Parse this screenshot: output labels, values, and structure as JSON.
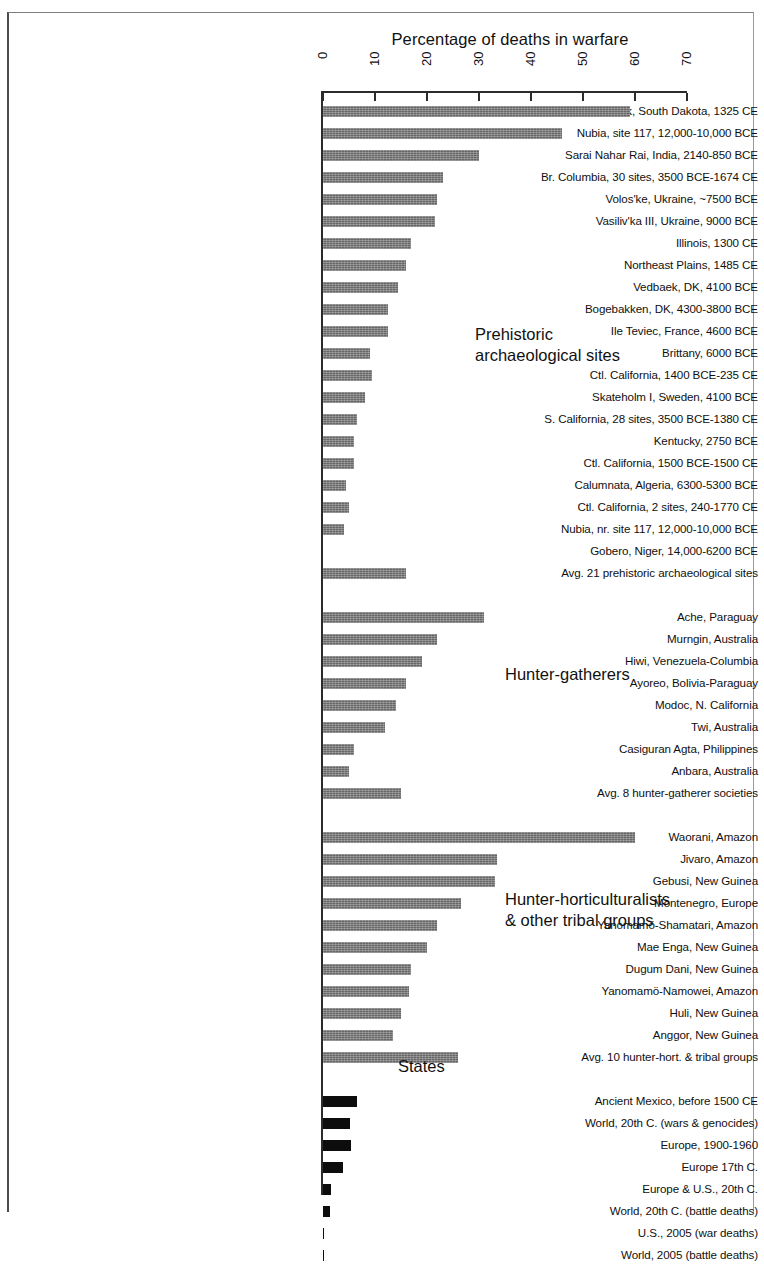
{
  "chart_data": {
    "type": "bar",
    "orientation": "horizontal",
    "title": "Percentage of deaths in warfare",
    "xlabel": "Percentage of deaths in warfare",
    "ylabel": "",
    "xlim": [
      0,
      70
    ],
    "xticks": [
      "0",
      "10",
      "20",
      "30",
      "40",
      "50",
      "60",
      "70"
    ],
    "grid": false,
    "legend": "none",
    "groups": [
      {
        "name": "Prehistoric archaeological sites",
        "annotation_lines": [
          "Prehistoric",
          "archaeological sites"
        ],
        "bar_style": "gray",
        "categories": [
          "Crow Creek, South Dakota, 1325 CE",
          "Nubia, site 117, 12,000-10,000 BCE",
          "Sarai Nahar Rai, India, 2140-850 BCE",
          "Br. Columbia, 30 sites, 3500 BCE-1674 CE",
          "Volos'ke, Ukraine, ~7500 BCE",
          "Vasiliv'ka III, Ukraine, 9000 BCE",
          "Illinois, 1300 CE",
          "Northeast Plains, 1485 CE",
          "Vedbaek, DK, 4100 BCE",
          "Bogebakken, DK, 4300-3800 BCE",
          "Ile Teviec, France, 4600 BCE",
          "Brittany, 6000 BCE",
          "Ctl. California, 1400 BCE-235 CE",
          "Skateholm I, Sweden, 4100 BCE",
          "S. California, 28 sites, 3500 BCE-1380 CE",
          "Kentucky, 2750 BCE",
          "Ctl. California, 1500 BCE-1500 CE",
          "Calumnata, Algeria, 6300-5300 BCE",
          "Ctl. California, 2 sites, 240-1770 CE",
          "Nubia, nr. site 117, 12,000-10,000 BCE",
          "Gobero, Niger, 14,000-6200 BCE",
          "Avg. 21 prehistoric archaeological sites"
        ],
        "values": [
          59,
          46,
          30,
          23,
          22,
          21.5,
          17,
          16,
          14.5,
          12.5,
          12.5,
          9,
          9.5,
          8,
          6.5,
          6,
          6,
          4.5,
          5,
          4,
          0,
          16
        ]
      },
      {
        "name": "Hunter-gatherers",
        "annotation_lines": [
          "Hunter-gatherers"
        ],
        "bar_style": "gray",
        "categories": [
          "Ache, Paraguay",
          "Murngin, Australia",
          "Hiwi, Venezuela-Columbia",
          "Ayoreo, Bolivia-Paraguay",
          "Modoc, N. California",
          "Twi, Australia",
          "Casiguran Agta, Philippines",
          "Anbara, Australia",
          "Avg. 8 hunter-gatherer societies"
        ],
        "values": [
          31,
          22,
          19,
          16,
          14,
          12,
          6,
          5,
          15
        ]
      },
      {
        "name": "Hunter-horticulturalists & other tribal groups",
        "annotation_lines": [
          "Hunter-horticulturalists",
          "& other tribal groups"
        ],
        "bar_style": "gray",
        "categories": [
          "Waorani, Amazon",
          "Jivaro, Amazon",
          "Gebusi, New Guinea",
          "Montenegro, Europe",
          "Yanomamö-Shamatari, Amazon",
          "Mae Enga, New Guinea",
          "Dugum Dani, New Guinea",
          "Yanomamö-Namowei, Amazon",
          "Huli, New Guinea",
          "Anggor, New Guinea",
          "Avg. 10 hunter-hort. & tribal groups"
        ],
        "values": [
          60,
          33.5,
          33,
          26.5,
          22,
          20,
          17,
          16.5,
          15,
          13.5,
          26
        ]
      },
      {
        "name": "States",
        "annotation_lines": [
          "States"
        ],
        "bar_style": "black",
        "categories": [
          "Ancient Mexico, before 1500 CE",
          "World, 20th C. (wars & genocides)",
          "Europe, 1900-1960",
          "Europe 17th C.",
          "Europe & U.S., 20th C.",
          "World, 20th C. (battle deaths)",
          "U.S., 2005 (war deaths)",
          "World, 2005 (battle deaths)"
        ],
        "values": [
          6.5,
          5.2,
          5.3,
          3.8,
          1.6,
          1.4,
          0.25,
          0.12
        ]
      }
    ]
  },
  "colors": {
    "bar_gray": "#6e6e6e",
    "bar_black": "#0d0d0d",
    "axis": "#2b2b2b",
    "text": "#101010"
  }
}
